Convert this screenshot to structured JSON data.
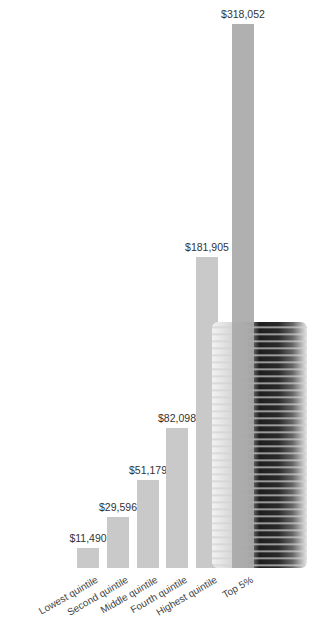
{
  "chart_data": {
    "type": "bar",
    "title": "",
    "xlabel": "",
    "ylabel": "",
    "categories": [
      "Lowest quintile",
      "Second quintile",
      "Middle quintile",
      "Fourth quintile",
      "Highest quintile",
      "Top 5%"
    ],
    "values": [
      11490,
      29596,
      51179,
      82098,
      181905,
      318052
    ],
    "value_labels": [
      "$11,490",
      "$29,596",
      "$51,179",
      "$82,098",
      "$181,905",
      "$318,052"
    ],
    "ylim": [
      0,
      318052
    ],
    "grid": false,
    "legend": "none",
    "decoration": "stack of coins behind Top 5% bar"
  },
  "colors": {
    "bar": "#c9c9c9",
    "highlight_bar": "#a9a9a9",
    "text": "#333333"
  }
}
